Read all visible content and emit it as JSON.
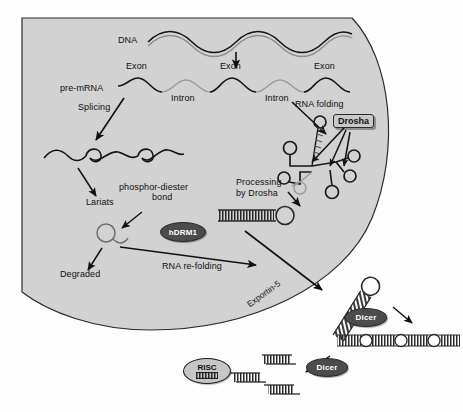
{
  "figure": {
    "background": "#fdfdfd",
    "nucleus_fill": "#d2d2d2",
    "nucleus_stroke": "#2b2b2b"
  },
  "labels": {
    "dna": "DNA",
    "pre_mrna": "pre-mRNA",
    "exon_1": "Exon",
    "exon_2": "Exon",
    "exon_3": "Exon",
    "intron_1": "Intron",
    "intron_2": "Intron",
    "splicing": "Splicing",
    "rna_folding": "RNA folding",
    "phosphor_diester": "phosphor-diester",
    "bond": "bond",
    "lariats": "Lariats",
    "degraded": "Degraded",
    "processing": "Processing",
    "by_drosha": "by Drosha",
    "rna_refolding": "RNA re-folding",
    "exportin5": "Exportin-5"
  },
  "enzymes": {
    "drosha": "Drosha",
    "hdrm1": "hDRM1",
    "dicer_1": "Dicer",
    "dicer_2": "Dicer",
    "risc": "RISC"
  },
  "colors": {
    "enzyme_fill": "#4c4c4c",
    "enzyme_text": "#ffffff",
    "drosha_box_fill": "#c9c9c9",
    "risc_fill": "#c6c6c6",
    "exon_stroke": "#141414",
    "intron_stroke": "#9a9a9a",
    "arrow": "#111111"
  },
  "structures": {
    "dna_helix": "double-helix-strand",
    "pre_mrna_strand": "wavy-exon-intron-strand",
    "spliced_mrna": "wavy-strand-with-loops",
    "lariat": "lariat-loop-with-tail",
    "folded_rna": "branched-hairpin-cluster",
    "pri_mirna_hairpin": "ladder-stem-with-loop",
    "pre_mirna_hairpin": "diagonal-hatched-stem-with-loop",
    "long_dsrna": "ladder-with-internal-bulges",
    "sirna_duplex_1": "short-duplex",
    "sirna_duplex_2": "short-duplex",
    "sirna_duplex_3": "short-duplex"
  }
}
